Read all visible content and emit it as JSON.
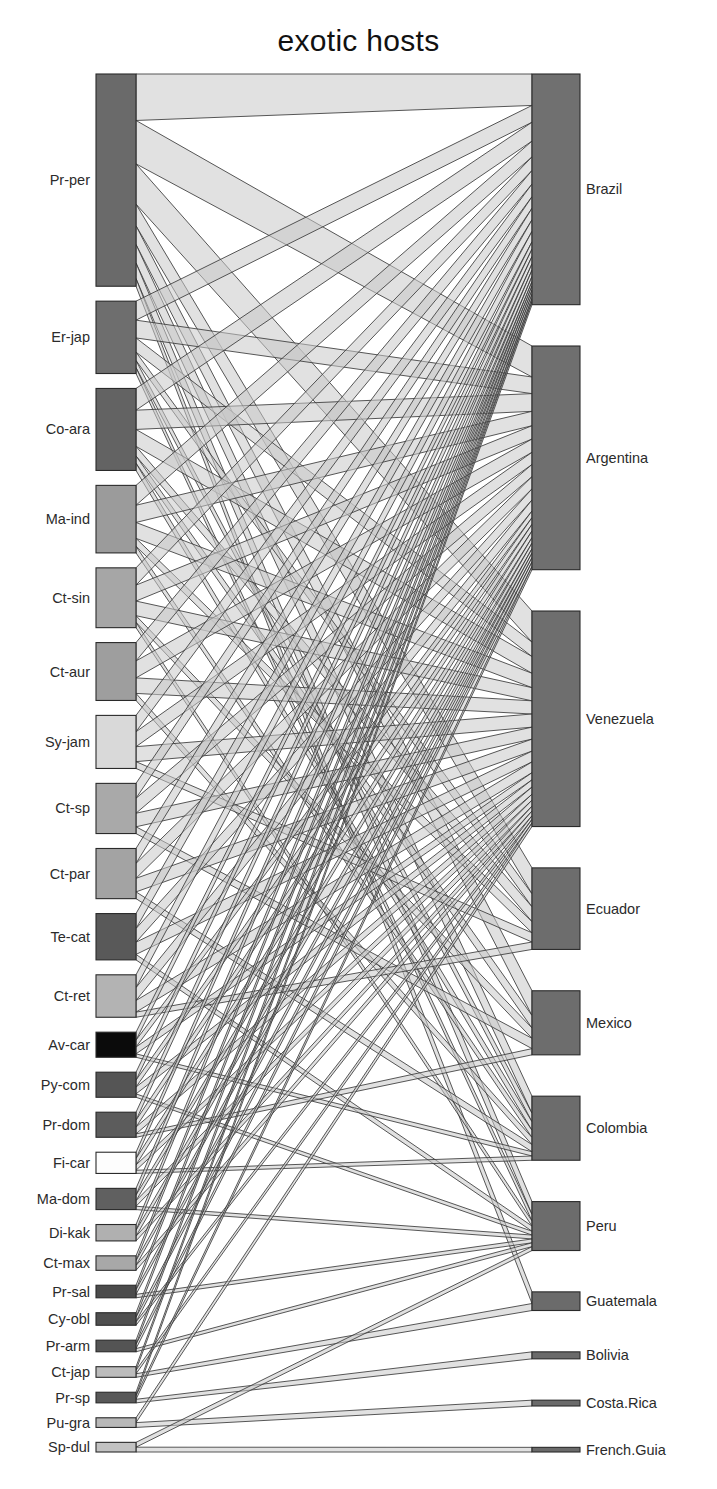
{
  "chart_data": {
    "type": "bipartite-network",
    "title": "exotic hosts",
    "xlabel": "",
    "ylabel": "",
    "legend_position": "none",
    "grid": false,
    "lower_level_name": "exotic hosts",
    "higher_level_name": "countries",
    "lower_nodes": [
      {
        "label": "Pr-per",
        "value": 220,
        "color": "#6a6a6a"
      },
      {
        "label": "Er-jap",
        "value": 75,
        "color": "#6e6e6e"
      },
      {
        "label": "Co-ara",
        "value": 85,
        "color": "#636363"
      },
      {
        "label": "Ma-ind",
        "value": 70,
        "color": "#9b9b9b"
      },
      {
        "label": "Ct-sin",
        "value": 62,
        "color": "#a6a6a6"
      },
      {
        "label": "Ct-aur",
        "value": 60,
        "color": "#9e9e9e"
      },
      {
        "label": "Sy-jam",
        "value": 55,
        "color": "#d9d9d9"
      },
      {
        "label": "Ct-sp",
        "value": 52,
        "color": "#a9a9a9"
      },
      {
        "label": "Ct-par",
        "value": 52,
        "color": "#a3a3a3"
      },
      {
        "label": "Te-cat",
        "value": 48,
        "color": "#595959"
      },
      {
        "label": "Ct-ret",
        "value": 44,
        "color": "#b3b3b3"
      },
      {
        "label": "Av-car",
        "value": 26,
        "color": "#0b0b0b"
      },
      {
        "label": "Py-com",
        "value": 26,
        "color": "#555555"
      },
      {
        "label": "Pr-dom",
        "value": 26,
        "color": "#5c5c5c"
      },
      {
        "label": "Fi-car",
        "value": 22,
        "color": "#fdfdfd"
      },
      {
        "label": "Ma-dom",
        "value": 22,
        "color": "#606060"
      },
      {
        "label": "Di-kak",
        "value": 17,
        "color": "#b0b0b0"
      },
      {
        "label": "Ct-max",
        "value": 15,
        "color": "#a8a8a8"
      },
      {
        "label": "Pr-sal",
        "value": 13,
        "color": "#4b4b4b"
      },
      {
        "label": "Cy-obl",
        "value": 13,
        "color": "#4f4f4f"
      },
      {
        "label": "Pr-arm",
        "value": 12,
        "color": "#545454"
      },
      {
        "label": "Ct-jap",
        "value": 11,
        "color": "#bcbcbc"
      },
      {
        "label": "Pr-sp",
        "value": 11,
        "color": "#585858"
      },
      {
        "label": "Pu-gra",
        "value": 10,
        "color": "#b8b8b8"
      },
      {
        "label": "Sp-dul",
        "value": 10,
        "color": "#c2c2c2"
      }
    ],
    "higher_nodes": [
      {
        "label": "Brazil",
        "value": 198,
        "color": "#707070"
      },
      {
        "label": "Argentina",
        "value": 192,
        "color": "#6f6f6f"
      },
      {
        "label": "Venezuela",
        "value": 185,
        "color": "#6e6e6e"
      },
      {
        "label": "Ecuador",
        "value": 70,
        "color": "#6d6d6d"
      },
      {
        "label": "Mexico",
        "value": 55,
        "color": "#6d6d6d"
      },
      {
        "label": "Colombia",
        "value": 55,
        "color": "#6c6c6c"
      },
      {
        "label": "Peru",
        "value": 42,
        "color": "#6c6c6c"
      },
      {
        "label": "Guatemala",
        "value": 16,
        "color": "#6b6b6b"
      },
      {
        "label": "Bolivia",
        "value": 6,
        "color": "#6a6a6a"
      },
      {
        "label": "Costa.Rica",
        "value": 5,
        "color": "#6a6a6a"
      },
      {
        "label": "French.Guia",
        "value": 4,
        "color": "#6a6a6a"
      }
    ],
    "links": [
      {
        "source": "Pr-per",
        "target": "Brazil",
        "value": 30
      },
      {
        "source": "Pr-per",
        "target": "Argentina",
        "value": 28
      },
      {
        "source": "Pr-per",
        "target": "Venezuela",
        "value": 26
      },
      {
        "source": "Pr-per",
        "target": "Ecuador",
        "value": 14
      },
      {
        "source": "Pr-per",
        "target": "Mexico",
        "value": 12
      },
      {
        "source": "Pr-per",
        "target": "Colombia",
        "value": 12
      },
      {
        "source": "Pr-per",
        "target": "Peru",
        "value": 10
      },
      {
        "source": "Pr-per",
        "target": "Guatemala",
        "value": 5
      },
      {
        "source": "Er-jap",
        "target": "Brazil",
        "value": 16
      },
      {
        "source": "Er-jap",
        "target": "Argentina",
        "value": 15
      },
      {
        "source": "Er-jap",
        "target": "Venezuela",
        "value": 12
      },
      {
        "source": "Er-jap",
        "target": "Ecuador",
        "value": 7
      },
      {
        "source": "Er-jap",
        "target": "Colombia",
        "value": 6
      },
      {
        "source": "Er-jap",
        "target": "Peru",
        "value": 5
      },
      {
        "source": "Co-ara",
        "target": "Brazil",
        "value": 18
      },
      {
        "source": "Co-ara",
        "target": "Argentina",
        "value": 16
      },
      {
        "source": "Co-ara",
        "target": "Venezuela",
        "value": 14
      },
      {
        "source": "Co-ara",
        "target": "Ecuador",
        "value": 8
      },
      {
        "source": "Co-ara",
        "target": "Mexico",
        "value": 6
      },
      {
        "source": "Co-ara",
        "target": "Colombia",
        "value": 6
      },
      {
        "source": "Ma-ind",
        "target": "Brazil",
        "value": 15
      },
      {
        "source": "Ma-ind",
        "target": "Argentina",
        "value": 13
      },
      {
        "source": "Ma-ind",
        "target": "Venezuela",
        "value": 12
      },
      {
        "source": "Ma-ind",
        "target": "Ecuador",
        "value": 6
      },
      {
        "source": "Ma-ind",
        "target": "Colombia",
        "value": 5
      },
      {
        "source": "Ct-sin",
        "target": "Brazil",
        "value": 13
      },
      {
        "source": "Ct-sin",
        "target": "Argentina",
        "value": 12
      },
      {
        "source": "Ct-sin",
        "target": "Venezuela",
        "value": 11
      },
      {
        "source": "Ct-sin",
        "target": "Mexico",
        "value": 5
      },
      {
        "source": "Ct-sin",
        "target": "Peru",
        "value": 4
      },
      {
        "source": "Ct-aur",
        "target": "Brazil",
        "value": 13
      },
      {
        "source": "Ct-aur",
        "target": "Argentina",
        "value": 12
      },
      {
        "source": "Ct-aur",
        "target": "Venezuela",
        "value": 11
      },
      {
        "source": "Ct-aur",
        "target": "Colombia",
        "value": 5
      },
      {
        "source": "Sy-jam",
        "target": "Brazil",
        "value": 12
      },
      {
        "source": "Sy-jam",
        "target": "Argentina",
        "value": 11
      },
      {
        "source": "Sy-jam",
        "target": "Venezuela",
        "value": 11
      },
      {
        "source": "Sy-jam",
        "target": "Ecuador",
        "value": 5
      },
      {
        "source": "Ct-sp",
        "target": "Brazil",
        "value": 11
      },
      {
        "source": "Ct-sp",
        "target": "Argentina",
        "value": 11
      },
      {
        "source": "Ct-sp",
        "target": "Venezuela",
        "value": 10
      },
      {
        "source": "Ct-sp",
        "target": "Mexico",
        "value": 5
      },
      {
        "source": "Ct-par",
        "target": "Brazil",
        "value": 11
      },
      {
        "source": "Ct-par",
        "target": "Argentina",
        "value": 11
      },
      {
        "source": "Ct-par",
        "target": "Venezuela",
        "value": 10
      },
      {
        "source": "Ct-par",
        "target": "Colombia",
        "value": 5
      },
      {
        "source": "Te-cat",
        "target": "Brazil",
        "value": 11
      },
      {
        "source": "Te-cat",
        "target": "Argentina",
        "value": 10
      },
      {
        "source": "Te-cat",
        "target": "Venezuela",
        "value": 9
      },
      {
        "source": "Te-cat",
        "target": "Peru",
        "value": 4
      },
      {
        "source": "Ct-ret",
        "target": "Brazil",
        "value": 10
      },
      {
        "source": "Ct-ret",
        "target": "Argentina",
        "value": 10
      },
      {
        "source": "Ct-ret",
        "target": "Venezuela",
        "value": 9
      },
      {
        "source": "Ct-ret",
        "target": "Ecuador",
        "value": 4
      },
      {
        "source": "Av-car",
        "target": "Brazil",
        "value": 7
      },
      {
        "source": "Av-car",
        "target": "Argentina",
        "value": 6
      },
      {
        "source": "Av-car",
        "target": "Venezuela",
        "value": 6
      },
      {
        "source": "Av-car",
        "target": "Colombia",
        "value": 3
      },
      {
        "source": "Py-com",
        "target": "Brazil",
        "value": 7
      },
      {
        "source": "Py-com",
        "target": "Argentina",
        "value": 6
      },
      {
        "source": "Py-com",
        "target": "Venezuela",
        "value": 6
      },
      {
        "source": "Py-com",
        "target": "Peru",
        "value": 3
      },
      {
        "source": "Pr-dom",
        "target": "Brazil",
        "value": 7
      },
      {
        "source": "Pr-dom",
        "target": "Argentina",
        "value": 6
      },
      {
        "source": "Pr-dom",
        "target": "Venezuela",
        "value": 6
      },
      {
        "source": "Pr-dom",
        "target": "Mexico",
        "value": 3
      },
      {
        "source": "Fi-car",
        "target": "Brazil",
        "value": 6
      },
      {
        "source": "Fi-car",
        "target": "Argentina",
        "value": 6
      },
      {
        "source": "Fi-car",
        "target": "Venezuela",
        "value": 5
      },
      {
        "source": "Fi-car",
        "target": "Colombia",
        "value": 3
      },
      {
        "source": "Ma-dom",
        "target": "Brazil",
        "value": 6
      },
      {
        "source": "Ma-dom",
        "target": "Argentina",
        "value": 5
      },
      {
        "source": "Ma-dom",
        "target": "Venezuela",
        "value": 5
      },
      {
        "source": "Ma-dom",
        "target": "Peru",
        "value": 3
      },
      {
        "source": "Di-kak",
        "target": "Brazil",
        "value": 5
      },
      {
        "source": "Di-kak",
        "target": "Argentina",
        "value": 5
      },
      {
        "source": "Di-kak",
        "target": "Venezuela",
        "value": 4
      },
      {
        "source": "Ct-max",
        "target": "Brazil",
        "value": 4
      },
      {
        "source": "Ct-max",
        "target": "Argentina",
        "value": 4
      },
      {
        "source": "Ct-max",
        "target": "Venezuela",
        "value": 4
      },
      {
        "source": "Pr-sal",
        "target": "Brazil",
        "value": 4
      },
      {
        "source": "Pr-sal",
        "target": "Argentina",
        "value": 4
      },
      {
        "source": "Pr-sal",
        "target": "Peru",
        "value": 3
      },
      {
        "source": "Cy-obl",
        "target": "Brazil",
        "value": 4
      },
      {
        "source": "Cy-obl",
        "target": "Argentina",
        "value": 4
      },
      {
        "source": "Cy-obl",
        "target": "Venezuela",
        "value": 3
      },
      {
        "source": "Pr-arm",
        "target": "Brazil",
        "value": 4
      },
      {
        "source": "Pr-arm",
        "target": "Argentina",
        "value": 4
      },
      {
        "source": "Pr-arm",
        "target": "Peru",
        "value": 3
      },
      {
        "source": "Ct-jap",
        "target": "Brazil",
        "value": 3
      },
      {
        "source": "Ct-jap",
        "target": "Venezuela",
        "value": 3
      },
      {
        "source": "Ct-jap",
        "target": "Guatemala",
        "value": 3
      },
      {
        "source": "Pr-sp",
        "target": "Brazil",
        "value": 3
      },
      {
        "source": "Pr-sp",
        "target": "Argentina",
        "value": 3
      },
      {
        "source": "Pr-sp",
        "target": "Bolivia",
        "value": 3
      },
      {
        "source": "Pu-gra",
        "target": "Venezuela",
        "value": 3
      },
      {
        "source": "Pu-gra",
        "target": "Costa.Rica",
        "value": 3
      },
      {
        "source": "Sp-dul",
        "target": "Peru",
        "value": 3
      },
      {
        "source": "Sp-dul",
        "target": "French.Guia",
        "value": 3
      }
    ]
  },
  "colors": {
    "ribbon_fill": "#c8c8c8",
    "ribbon_stroke": "#3a3a3a",
    "bar_stroke": "#2a2a2a",
    "background": "#ffffff",
    "text": "#2b2b2b"
  },
  "layout": {
    "left_bar_x": 96,
    "left_bar_width": 40,
    "right_bar_x": 532,
    "right_bar_width": 48,
    "left_label_right_edge": 90,
    "right_label_left_edge": 586,
    "top": 74,
    "bottom": 1452
  }
}
